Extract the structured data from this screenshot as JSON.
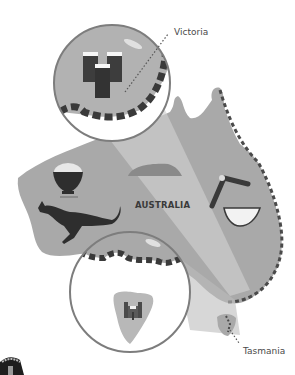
{
  "map": {
    "title": "AUSTRALIA",
    "callouts": [
      {
        "label": "Victoria",
        "icon": "beer-glasses-icon"
      },
      {
        "label": "Tasmania",
        "icon": "castle-icon"
      }
    ],
    "icons": [
      "rice-bowl-icon",
      "kangaroo-icon",
      "uluru-rock-icon",
      "boomerang-icon",
      "melon-slice-icon"
    ]
  },
  "colors": {
    "land": "#a9a9a9",
    "land_light": "#c4c4c4",
    "coast": "#555555",
    "ring": "#7d7d7d",
    "beam": "#d6d6d6",
    "dark": "#2e2e2e"
  }
}
